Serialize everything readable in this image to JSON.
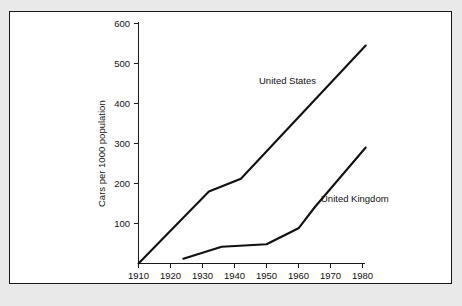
{
  "figure": {
    "background_color": "#e9e9e9",
    "panel_color": "#ffffff",
    "border_color": "#1a1a1a",
    "line_color": "#111111"
  },
  "chart_data": {
    "type": "line",
    "title": "",
    "xlabel": "",
    "ylabel": "Cars per 1000 population",
    "xlim": [
      1910,
      1985
    ],
    "ylim": [
      0,
      620
    ],
    "xticks": [
      1910,
      1920,
      1930,
      1940,
      1950,
      1960,
      1970,
      1980
    ],
    "xtick_labels": [
      "1910",
      "1920",
      "1930",
      "1940",
      "1950",
      "1960",
      "1970",
      "1980"
    ],
    "yticks": [
      100,
      200,
      300,
      400,
      500,
      600
    ],
    "ytick_labels": [
      "100",
      "200",
      "300",
      "400",
      "500",
      "600"
    ],
    "grid": false,
    "legend": "inline-annotations",
    "series": [
      {
        "name": "United States",
        "label_text": "United States",
        "x": [
          1910,
          1932,
          1942,
          1981
        ],
        "values": [
          0,
          180,
          212,
          545
        ]
      },
      {
        "name": "United Kingdom",
        "label_text": "United Kingdom",
        "x": [
          1924,
          1936,
          1950,
          1960,
          1965,
          1981
        ],
        "values": [
          12,
          42,
          48,
          88,
          140,
          290
        ]
      }
    ]
  }
}
